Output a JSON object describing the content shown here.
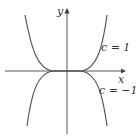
{
  "diagram": {
    "axes": {
      "x_label": "x",
      "y_label": "y"
    },
    "curves": [
      {
        "label": "c = 1",
        "c": 1,
        "description": "y = c x^n (even power), opening upward"
      },
      {
        "label": "c = −1",
        "c": -1,
        "description": "y = c x^n (even power), opening downward"
      }
    ],
    "colors": {
      "curve": "#555555",
      "axis": "#444444",
      "background": "#ffffff"
    }
  }
}
